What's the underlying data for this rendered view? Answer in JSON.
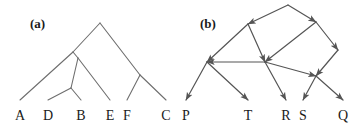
{
  "figure": {
    "width": 364,
    "height": 130,
    "background": "#ffffff",
    "line_color": "#6e6e6e",
    "text_color": "#1a1a1a"
  },
  "panels": [
    {
      "key": "a",
      "label": "(a)",
      "label_x": 30,
      "label_y": 18,
      "type": "phylogenetic-tree",
      "tips": [
        {
          "name": "A",
          "label": "A",
          "x": 20,
          "y": 110
        },
        {
          "name": "D",
          "label": "D",
          "x": 48,
          "y": 110
        },
        {
          "name": "B",
          "label": "B",
          "x": 81,
          "y": 110
        },
        {
          "name": "E",
          "label": "E",
          "x": 110,
          "y": 110
        },
        {
          "name": "F",
          "label": "F",
          "x": 127,
          "y": 110
        },
        {
          "name": "C",
          "label": "C",
          "x": 166,
          "y": 110
        }
      ],
      "internal_nodes": [
        {
          "name": "root",
          "x": 100,
          "y": 23
        },
        {
          "name": "n1",
          "x": 73,
          "y": 52
        },
        {
          "name": "n2",
          "x": 78,
          "y": 58
        },
        {
          "name": "n3",
          "x": 71,
          "y": 88
        },
        {
          "name": "n4",
          "x": 140,
          "y": 75
        }
      ],
      "edges": [
        {
          "from": "root",
          "to": "n1"
        },
        {
          "from": "root",
          "to": "n4"
        },
        {
          "from": "n1",
          "to": "A"
        },
        {
          "from": "n1",
          "to": "n2"
        },
        {
          "from": "n2",
          "to": "n3"
        },
        {
          "from": "n2",
          "to": "E"
        },
        {
          "from": "n3",
          "to": "D"
        },
        {
          "from": "n3",
          "to": "B"
        },
        {
          "from": "n4",
          "to": "F"
        },
        {
          "from": "n4",
          "to": "C"
        }
      ]
    },
    {
      "key": "b",
      "label": "(b)",
      "label_x": 200,
      "label_y": 18,
      "type": "directed-graph",
      "tips": [
        {
          "name": "P",
          "label": "P",
          "x": 186,
          "y": 110
        },
        {
          "name": "T",
          "label": "T",
          "x": 248,
          "y": 110
        },
        {
          "name": "R",
          "label": "R",
          "x": 286,
          "y": 110
        },
        {
          "name": "S",
          "label": "S",
          "x": 303,
          "y": 110
        },
        {
          "name": "Q",
          "label": "Q",
          "x": 343,
          "y": 110
        }
      ],
      "internal_nodes": [
        {
          "name": "top",
          "x": 288,
          "y": 5
        },
        {
          "name": "upper-left",
          "x": 248,
          "y": 24
        },
        {
          "name": "upper-right",
          "x": 316,
          "y": 22
        },
        {
          "name": "right",
          "x": 338,
          "y": 50
        },
        {
          "name": "left-hub",
          "x": 207,
          "y": 62
        },
        {
          "name": "center-hub",
          "x": 265,
          "y": 62
        },
        {
          "name": "lower-right-hub",
          "x": 316,
          "y": 76
        }
      ],
      "edges": [
        {
          "from": "top",
          "to": "upper-left",
          "arrow": true
        },
        {
          "from": "top",
          "to": "upper-right",
          "arrow": true
        },
        {
          "from": "upper-left",
          "to": "left-hub",
          "arrow": true
        },
        {
          "from": "upper-left",
          "to": "center-hub",
          "arrow": true
        },
        {
          "from": "upper-right",
          "to": "center-hub",
          "arrow": true
        },
        {
          "from": "upper-right",
          "to": "right",
          "arrow": true
        },
        {
          "from": "right",
          "to": "lower-right-hub",
          "arrow": true
        },
        {
          "from": "center-hub",
          "to": "left-hub",
          "arrow": true
        },
        {
          "from": "center-hub",
          "to": "lower-right-hub",
          "arrow": true
        },
        {
          "from": "left-hub",
          "to": "P",
          "arrow": true
        },
        {
          "from": "left-hub",
          "to": "T",
          "arrow": true
        },
        {
          "from": "center-hub",
          "to": "R",
          "arrow": true
        },
        {
          "from": "lower-right-hub",
          "to": "S",
          "arrow": true
        },
        {
          "from": "lower-right-hub",
          "to": "Q",
          "arrow": true
        }
      ]
    }
  ]
}
